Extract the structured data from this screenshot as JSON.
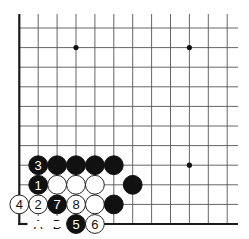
{
  "diagram": {
    "type": "go-board-fragment",
    "corner": "bottom-left",
    "grid": {
      "columns": 12,
      "rows": 11
    },
    "star_points": [
      {
        "col": 3,
        "row": 9
      },
      {
        "col": 9,
        "row": 9
      },
      {
        "col": 9,
        "row": 3
      }
    ],
    "stones": [
      {
        "col": 1,
        "row": 3,
        "color": "black",
        "label": "3"
      },
      {
        "col": 2,
        "row": 3,
        "color": "black",
        "label": ""
      },
      {
        "col": 3,
        "row": 3,
        "color": "black",
        "label": ""
      },
      {
        "col": 4,
        "row": 3,
        "color": "black",
        "label": ""
      },
      {
        "col": 5,
        "row": 3,
        "color": "black",
        "label": ""
      },
      {
        "col": 1,
        "row": 2,
        "color": "black",
        "label": "1"
      },
      {
        "col": 2,
        "row": 2,
        "color": "white",
        "label": ""
      },
      {
        "col": 3,
        "row": 2,
        "color": "white",
        "label": ""
      },
      {
        "col": 4,
        "row": 2,
        "color": "white",
        "label": ""
      },
      {
        "col": 6,
        "row": 2,
        "color": "black",
        "label": ""
      },
      {
        "col": 0,
        "row": 1,
        "color": "white",
        "label": "4"
      },
      {
        "col": 1,
        "row": 1,
        "color": "white",
        "label": "2"
      },
      {
        "col": 2,
        "row": 1,
        "color": "black",
        "label": "7"
      },
      {
        "col": 3,
        "row": 1,
        "color": "white",
        "label": "8"
      },
      {
        "col": 4,
        "row": 1,
        "color": "white",
        "label": ""
      },
      {
        "col": 5,
        "row": 1,
        "color": "black",
        "label": ""
      },
      {
        "col": 3,
        "row": 0,
        "color": "black",
        "label": "5"
      },
      {
        "col": 4,
        "row": 0,
        "color": "white",
        "label": "6"
      }
    ],
    "point_labels": [
      {
        "col": 1,
        "row": 0,
        "text": "A"
      },
      {
        "col": 2,
        "row": 0,
        "text": "B"
      }
    ],
    "colors": {
      "black_stone": "#111111",
      "white_stone": "#ffffff",
      "grid": "#555555",
      "border": "#1a1a1a"
    }
  }
}
